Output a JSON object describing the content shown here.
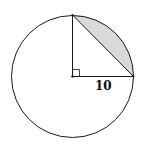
{
  "diagram": {
    "type": "circle-segment",
    "radius_label": "10",
    "right_angle_marker": true,
    "colors": {
      "stroke": "#1a1a1a",
      "shade": "#d9d9d9",
      "background": "#ffffff"
    }
  }
}
